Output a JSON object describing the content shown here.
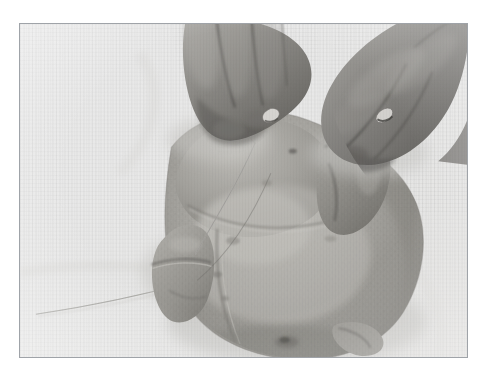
{
  "page": {
    "background_color": "#ffffff",
    "width": 490,
    "height": 379
  },
  "photo": {
    "frame": {
      "border_color": "#9fa3a8",
      "border_width_px": 1,
      "left": 19,
      "top": 23,
      "width": 449,
      "height": 335
    },
    "alt_text": "Black and white photograph: two hands pull kitchen string taut around a whole raw chicken resting breast-up on a white cloth surface, demonstrating how to truss poultry.",
    "media": "black-and-white photograph",
    "subject": "whole raw chicken being trussed with string",
    "surface": "white cloth",
    "palette": {
      "paper_white": "#fdfdfd",
      "highlight": "#f2f1ef",
      "light_gray": "#d7d6d3",
      "mid_gray": "#a9a8a4",
      "bird_gray": "#9a9994",
      "shadow_gray": "#7d7c78",
      "dark_gray": "#66655f",
      "deepest": "#3f3e3a",
      "string_gray": "#b9b8b4"
    },
    "elements": [
      {
        "name": "left-hand",
        "label": "Left hand holding string"
      },
      {
        "name": "right-hand",
        "label": "Right hand pulling string"
      },
      {
        "name": "fingernail-left",
        "label": "Fingernail highlight on left hand"
      },
      {
        "name": "fingernail-right",
        "label": "Fingernail highlight on right hand"
      },
      {
        "name": "chicken-body",
        "label": "Chicken breast and body"
      },
      {
        "name": "chicken-wing",
        "label": "Folded wing"
      },
      {
        "name": "chicken-leg",
        "label": "Drumstick tucked against body"
      },
      {
        "name": "chicken-tail",
        "label": "Tail end of the bird"
      },
      {
        "name": "trussing-string",
        "label": "Kitchen string running across the cloth"
      }
    ]
  }
}
